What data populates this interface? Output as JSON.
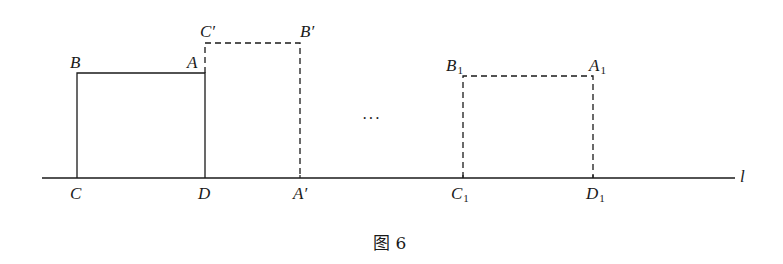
{
  "figure": {
    "caption": "图 6",
    "line_label": "l",
    "ellipsis": "···",
    "colors": {
      "stroke": "#1a1a1a",
      "background": "#ffffff"
    },
    "original_rect": {
      "style": "solid",
      "vertices": [
        {
          "name": "B",
          "base": "B",
          "sub": "",
          "prime": ""
        },
        {
          "name": "A",
          "base": "A",
          "sub": "",
          "prime": ""
        },
        {
          "name": "C",
          "base": "C",
          "sub": "",
          "prime": ""
        },
        {
          "name": "D",
          "base": "D",
          "sub": "",
          "prime": ""
        }
      ]
    },
    "rotated_rect": {
      "style": "dashed",
      "vertices": [
        {
          "name": "C'",
          "base": "C",
          "sub": "",
          "prime": "′"
        },
        {
          "name": "B'",
          "base": "B",
          "sub": "",
          "prime": "′"
        },
        {
          "name": "A'",
          "base": "A",
          "sub": "",
          "prime": "′"
        },
        {
          "name": "D",
          "base": "D",
          "sub": "",
          "prime": ""
        }
      ]
    },
    "final_rect": {
      "style": "dashed",
      "vertices": [
        {
          "name": "B1",
          "base": "B",
          "sub": "1",
          "prime": ""
        },
        {
          "name": "A1",
          "base": "A",
          "sub": "1",
          "prime": ""
        },
        {
          "name": "C1",
          "base": "C",
          "sub": "1",
          "prime": ""
        },
        {
          "name": "D1",
          "base": "D",
          "sub": "1",
          "prime": ""
        }
      ]
    }
  }
}
